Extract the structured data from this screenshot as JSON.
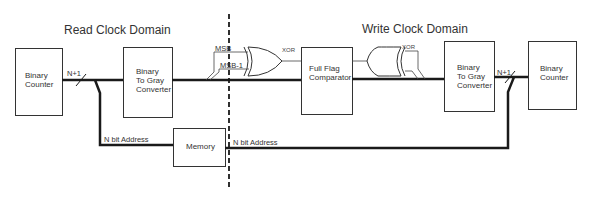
{
  "diagram": {
    "domains": {
      "read": "Read Clock Domain",
      "write": "Write Clock Domain"
    },
    "blocks": {
      "read_counter": [
        "Binary",
        "Counter"
      ],
      "read_b2g": [
        "Binary",
        "To Gray",
        "Converter"
      ],
      "full_flag": [
        "Full Flag",
        "Comparator"
      ],
      "write_b2g": [
        "Binary",
        "To Gray",
        "Converter"
      ],
      "write_counter": [
        "Binary",
        "Counter"
      ],
      "memory": "Memory"
    },
    "signals": {
      "read_bus": "N+1",
      "write_bus": "N+1",
      "msb": "MSB",
      "msb1": "MSB-1",
      "xor_left": "XOR",
      "xor_right": "XOR",
      "addr_left": "N bit Address",
      "addr_right": "N bit Address"
    },
    "colors": {
      "line": "#1a1a1a",
      "box_border": "#333333"
    }
  }
}
